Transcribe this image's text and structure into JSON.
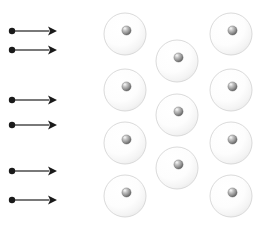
{
  "figure": {
    "canvas": {
      "width": 262,
      "height": 230,
      "background": "#ffffff"
    }
  },
  "colors": {
    "background": "#ffffff",
    "ray": "#1a1a1a",
    "ray_shaft": "#4d4d4d",
    "atom_shell_fill": "#fbfbfb",
    "atom_shell_edge": "#d6d6d6",
    "nucleus_light": "#f2f2f2",
    "nucleus_mid": "#9a9a9a",
    "nucleus_dark": "#4f4f4f"
  },
  "rays": {
    "label": "incident-rays",
    "count": 6,
    "direction": "left-to-right",
    "shaft_width": 1.6,
    "dot_radius": 3.2,
    "head_length": 9,
    "head_halfwidth": 4.6,
    "items": [
      {
        "id": "ray-1",
        "x_start": 12,
        "x_end": 57,
        "y": 31
      },
      {
        "id": "ray-2",
        "x_start": 12,
        "x_end": 57,
        "y": 50
      },
      {
        "id": "ray-3",
        "x_start": 12,
        "x_end": 57,
        "y": 100
      },
      {
        "id": "ray-4",
        "x_start": 12,
        "x_end": 57,
        "y": 125
      },
      {
        "id": "ray-5",
        "x_start": 12,
        "x_end": 57,
        "y": 171
      },
      {
        "id": "ray-6",
        "x_start": 12,
        "x_end": 57,
        "y": 200
      }
    ]
  },
  "lattice": {
    "label": "atomic-lattice",
    "arrangement": "staggered-close-packed",
    "column_count": 3,
    "atom_count": 11,
    "shell_radius": 21,
    "nucleus_radius": 4.6,
    "nucleus_offset_x": 1.5,
    "nucleus_offset_y": -3.5,
    "columns": [
      {
        "id": "column-left",
        "atom_count": 4,
        "atoms": [
          {
            "id": "atom-l1",
            "cx": 125,
            "cy": 34
          },
          {
            "id": "atom-l2",
            "cx": 125,
            "cy": 90
          },
          {
            "id": "atom-l3",
            "cx": 125,
            "cy": 143
          },
          {
            "id": "atom-l4",
            "cx": 125,
            "cy": 196
          }
        ]
      },
      {
        "id": "column-middle",
        "atom_count": 3,
        "atoms": [
          {
            "id": "atom-m1",
            "cx": 177,
            "cy": 61
          },
          {
            "id": "atom-m2",
            "cx": 177,
            "cy": 115
          },
          {
            "id": "atom-m3",
            "cx": 177,
            "cy": 168
          }
        ]
      },
      {
        "id": "column-right",
        "atom_count": 4,
        "atoms": [
          {
            "id": "atom-r1",
            "cx": 231,
            "cy": 34
          },
          {
            "id": "atom-r2",
            "cx": 231,
            "cy": 90
          },
          {
            "id": "atom-r3",
            "cx": 231,
            "cy": 143
          },
          {
            "id": "atom-r4",
            "cx": 231,
            "cy": 196
          }
        ]
      }
    ]
  }
}
